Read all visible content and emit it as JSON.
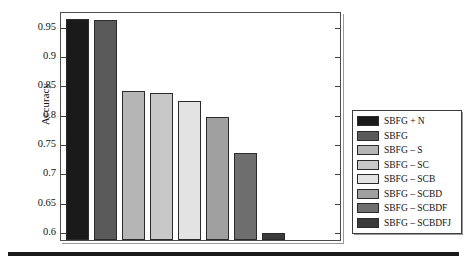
{
  "chart_data": {
    "type": "bar",
    "title": "",
    "xlabel": "",
    "ylabel": "Accuracy",
    "ylim": [
      0.585,
      0.975
    ],
    "yticks": [
      0.6,
      0.65,
      0.7,
      0.75,
      0.8,
      0.85,
      0.9,
      0.95
    ],
    "ytick_labels": [
      "0.6",
      "0.65",
      "0.7",
      "0.75",
      "0.8",
      "0.85",
      "0.9",
      "0.95"
    ],
    "grid": false,
    "legend_position": "right",
    "xtick_labels": [],
    "categories": [
      "SBFG + N",
      "SBFG",
      "SBFG – S",
      "SBFG – SC",
      "SBFG – SCB",
      "SBFG – SCBD",
      "SBFG – SCBDF",
      "SBFG – SCBDFJ"
    ],
    "values": [
      0.962,
      0.959,
      0.838,
      0.836,
      0.821,
      0.795,
      0.734,
      0.597
    ],
    "colors": [
      "#1a1a1a",
      "#5a5a5a",
      "#b5b5b5",
      "#c8c8c8",
      "#e3e3e3",
      "#a0a0a0",
      "#6e6e6e",
      "#3a3a3a"
    ]
  },
  "legend": {
    "items": [
      {
        "label": "SBFG + N",
        "color": "#1a1a1a"
      },
      {
        "label": "SBFG",
        "color": "#5a5a5a"
      },
      {
        "label": "SBFG – S",
        "color": "#b5b5b5"
      },
      {
        "label": "SBFG – SC",
        "color": "#c8c8c8"
      },
      {
        "label": "SBFG – SCB",
        "color": "#e3e3e3"
      },
      {
        "label": "SBFG – SCBD",
        "color": "#a0a0a0"
      },
      {
        "label": "SBFG – SCBDF",
        "color": "#6e6e6e"
      },
      {
        "label": "SBFG – SCBDFJ",
        "color": "#3a3a3a"
      }
    ]
  },
  "axes": {
    "y_title": "Accuracy",
    "frame_color": "#4d4d4d",
    "tick_color": "#3d3d3d"
  },
  "rule": {
    "color": "#1b1b1b"
  }
}
